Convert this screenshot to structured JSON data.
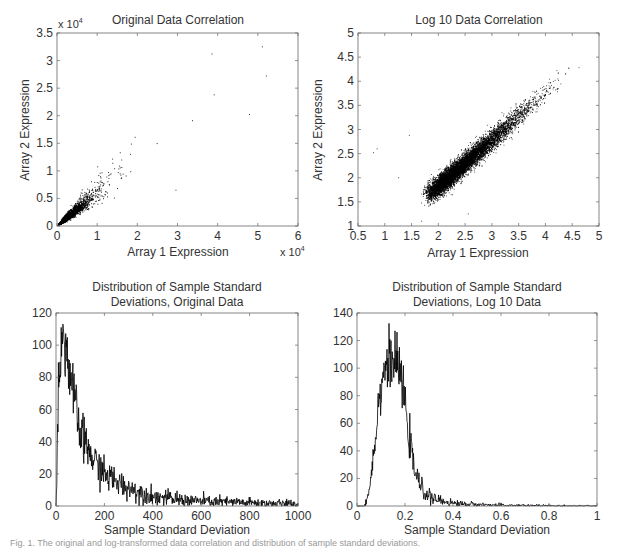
{
  "figure": {
    "caption_fragment": "Fig. 1. The original and log-transformed data correlation and distribution of sample standard deviations."
  },
  "chart_data": [
    {
      "id": "original-correlation",
      "type": "scatter",
      "title": "Original Data Correlation",
      "xlabel": "Array 1 Expression",
      "ylabel": "Array 2 Expression",
      "x_multiplier": "x 10^4",
      "y_multiplier": "x 10^4",
      "xlim": [
        0,
        6
      ],
      "ylim": [
        0,
        3.5
      ],
      "xticks": [
        "0",
        "1",
        "2",
        "3",
        "4",
        "5",
        "6"
      ],
      "yticks": [
        "0",
        "0.5",
        "1",
        "1.5",
        "2",
        "2.5",
        "3",
        "3.5"
      ],
      "grid": false,
      "description": "Dense cluster near origin (0-0.8 x10^4) with positive linear correlation, sparse points up to ~(5.1, 3.25) x10^4",
      "notable_points": [
        [
          5.1,
          3.25
        ],
        [
          5.2,
          2.72
        ],
        [
          4.78,
          2.02
        ],
        [
          3.85,
          3.12
        ],
        [
          3.9,
          2.38
        ],
        [
          2.95,
          0.65
        ]
      ]
    },
    {
      "id": "log-correlation",
      "type": "scatter",
      "title": "Log 10 Data Correlation",
      "xlabel": "Array 1 Expression",
      "ylabel": "Array 2 Expression",
      "xlim": [
        0.5,
        5
      ],
      "ylim": [
        1,
        5
      ],
      "xticks": [
        "0.5",
        "1",
        "1.5",
        "2",
        "2.5",
        "3",
        "3.5",
        "4",
        "4.5",
        "5"
      ],
      "yticks": [
        "1",
        "1.5",
        "2",
        "2.5",
        "3",
        "3.5",
        "4",
        "4.5",
        "5"
      ],
      "grid": false,
      "description": "Dense elongated band along y≈x from ~(1.6,1.5) to ~(4.6,4.5)",
      "notable_points": [
        [
          0.78,
          2.52
        ],
        [
          0.85,
          2.6
        ],
        [
          1.25,
          2.0
        ],
        [
          1.45,
          2.88
        ],
        [
          1.68,
          1.1
        ],
        [
          2.55,
          1.25
        ]
      ]
    },
    {
      "id": "sd-original",
      "type": "line",
      "title": "Distribution of Sample Standard Deviations, Original Data",
      "title_lines": [
        "Distribution of Sample Standard",
        "Deviations, Original Data"
      ],
      "xlabel": "Sample Standard Deviation",
      "ylabel": "",
      "xlim": [
        0,
        1000
      ],
      "ylim": [
        0,
        120
      ],
      "xticks": [
        "0",
        "200",
        "400",
        "600",
        "800",
        "1000"
      ],
      "yticks": [
        "0",
        "20",
        "40",
        "60",
        "80",
        "100",
        "120"
      ],
      "grid": false,
      "x": [
        0,
        10,
        20,
        30,
        40,
        60,
        80,
        100,
        150,
        200,
        250,
        300,
        400,
        500,
        600,
        700,
        800,
        900,
        1000
      ],
      "values": [
        0,
        70,
        100,
        105,
        100,
        80,
        62,
        45,
        30,
        20,
        15,
        11,
        6,
        4,
        3,
        2.5,
        2,
        1.5,
        1
      ]
    },
    {
      "id": "sd-log",
      "type": "line",
      "title": "Distribution of Sample Standard Deviations, Log 10 Data",
      "title_lines": [
        "Distribution of Sample Standard",
        "Deviations, Log 10 Data"
      ],
      "xlabel": "Sample Standard Deviation",
      "ylabel": "",
      "xlim": [
        0,
        1
      ],
      "ylim": [
        0,
        140
      ],
      "xticks": [
        "0",
        "0.2",
        "0.4",
        "0.6",
        "0.8",
        "1"
      ],
      "yticks": [
        "0",
        "20",
        "40",
        "60",
        "80",
        "100",
        "120",
        "140"
      ],
      "grid": false,
      "x": [
        0,
        0.03,
        0.05,
        0.07,
        0.09,
        0.11,
        0.13,
        0.15,
        0.17,
        0.19,
        0.21,
        0.23,
        0.25,
        0.28,
        0.32,
        0.4,
        0.5,
        0.6,
        0.8,
        1.0
      ],
      "values": [
        0,
        0,
        10,
        40,
        75,
        98,
        105,
        105,
        102,
        88,
        60,
        35,
        20,
        10,
        5,
        2,
        1,
        0.5,
        0.2,
        0
      ]
    }
  ],
  "colors": {
    "axis": "#555555",
    "data": "#000000",
    "text": "#333333"
  }
}
